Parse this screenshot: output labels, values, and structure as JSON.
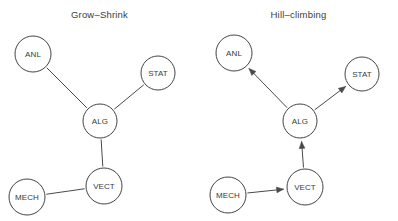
{
  "figure": {
    "width": 398,
    "height": 221,
    "background": "#ffffff",
    "stroke_color": "#4a4a4a",
    "text_color": "#3a3a3a"
  },
  "panels": [
    {
      "id": "grow-shrink",
      "title": "Grow–Shrink",
      "graph_type": "undirected",
      "nodes": [
        {
          "id": "ANL",
          "label": "ANL",
          "cx": 33,
          "cy": 54,
          "r": 18
        },
        {
          "id": "STAT",
          "label": "STAT",
          "cx": 158,
          "cy": 73,
          "r": 17
        },
        {
          "id": "ALG",
          "label": "ALG",
          "cx": 100,
          "cy": 121,
          "r": 17
        },
        {
          "id": "VECT",
          "label": "VECT",
          "cx": 104,
          "cy": 186,
          "r": 18
        },
        {
          "id": "MECH",
          "label": "MECH",
          "cx": 27,
          "cy": 197,
          "r": 18
        }
      ],
      "edges": [
        {
          "from": "ANL",
          "to": "ALG",
          "directed": false
        },
        {
          "from": "STAT",
          "to": "ALG",
          "directed": false
        },
        {
          "from": "ALG",
          "to": "VECT",
          "directed": false
        },
        {
          "from": "MECH",
          "to": "VECT",
          "directed": false
        }
      ]
    },
    {
      "id": "hill-climbing",
      "title": "Hill–climbing",
      "graph_type": "directed",
      "nodes": [
        {
          "id": "ANL",
          "label": "ANL",
          "cx": 35,
          "cy": 53,
          "r": 18
        },
        {
          "id": "STAT",
          "label": "STAT",
          "cx": 163,
          "cy": 74,
          "r": 17
        },
        {
          "id": "ALG",
          "label": "ALG",
          "cx": 101,
          "cy": 121,
          "r": 17
        },
        {
          "id": "VECT",
          "label": "VECT",
          "cx": 106,
          "cy": 187,
          "r": 18
        },
        {
          "id": "MECH",
          "label": "MECH",
          "cx": 29,
          "cy": 195,
          "r": 18
        }
      ],
      "edges": [
        {
          "from": "ALG",
          "to": "ANL",
          "directed": true
        },
        {
          "from": "ALG",
          "to": "STAT",
          "directed": true
        },
        {
          "from": "VECT",
          "to": "ALG",
          "directed": true
        },
        {
          "from": "MECH",
          "to": "VECT",
          "directed": true
        }
      ]
    }
  ]
}
